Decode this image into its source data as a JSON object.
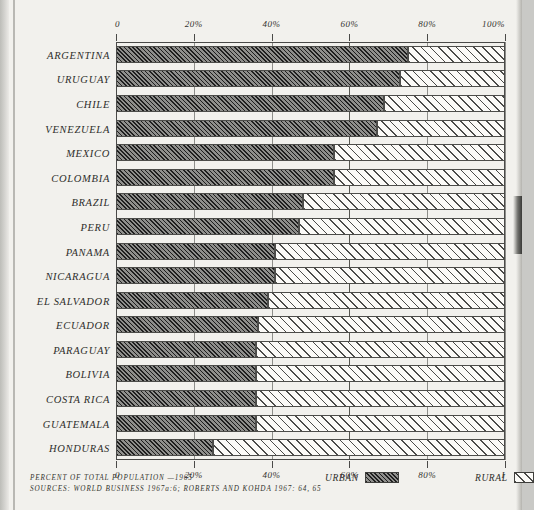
{
  "chart_data": {
    "type": "bar",
    "orientation": "horizontal",
    "stacked": true,
    "title": "",
    "xlabel": "PERCENT OF TOTAL POPULATION — 1965",
    "ylabel": "",
    "xlim": [
      0,
      100
    ],
    "grid": true,
    "legend_position": "bottom",
    "categories": [
      "ARGENTINA",
      "URUGUAY",
      "CHILE",
      "VENEZUELA",
      "MEXICO",
      "COLOMBIA",
      "BRAZIL",
      "PERU",
      "PANAMA",
      "NICARAGUA",
      "EL SALVADOR",
      "ECUADOR",
      "PARAGUAY",
      "BOLIVIA",
      "COSTA RICA",
      "GUATEMALA",
      "HONDURAS"
    ],
    "series": [
      {
        "name": "URBAN",
        "values": [
          75,
          73,
          69,
          67,
          56,
          56,
          48,
          47,
          41,
          41,
          39,
          36.5,
          36,
          36,
          36,
          36,
          25
        ]
      },
      {
        "name": "RURAL",
        "values": [
          25,
          27,
          31,
          33,
          44,
          44,
          52,
          53,
          59,
          59,
          61,
          63.5,
          64,
          64,
          64,
          64,
          75
        ]
      }
    ],
    "x_ticks": [
      0,
      20,
      40,
      60,
      80,
      100
    ],
    "x_tick_labels_top": [
      "0",
      "20%",
      "40%",
      "60%",
      "80%",
      "100%"
    ],
    "x_tick_labels_bottom": [
      "0",
      "20%",
      "40%",
      "60%",
      "80%",
      "I"
    ],
    "colors": {
      "urban_fill": "#8f8f8c",
      "rural_fill": "#fbfaf7",
      "frame": "#4a4a48",
      "paper": "#f2f1ed"
    }
  },
  "legend": {
    "urban_label": "URBAN",
    "rural_label": "RURAL"
  },
  "footer": {
    "caption": "PERCENT OF TOTAL POPULATION —1965",
    "sources": "SOURCES:  WORLD BUSINESS 1967a:6;  ROBERTS AND KOHDA 1967: 64, 65"
  }
}
